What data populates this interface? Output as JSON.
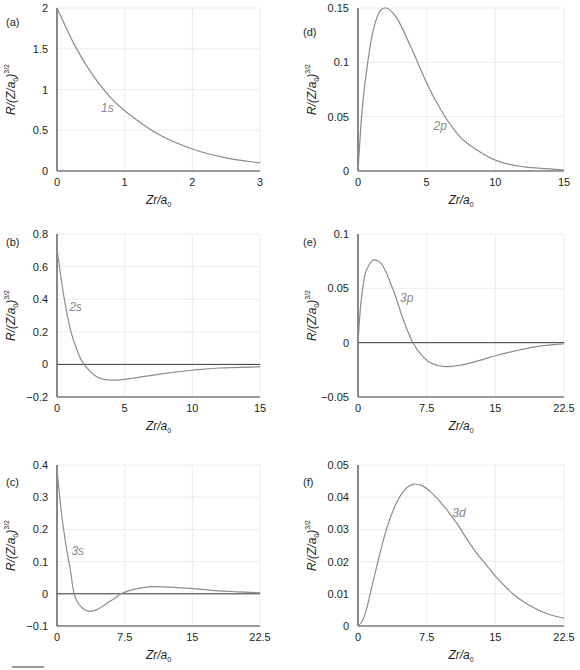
{
  "figure": {
    "footer_marker": "bar"
  },
  "chart_data": [
    {
      "id": "a",
      "panel_label": "(a)",
      "type": "line",
      "curve_label": "1s",
      "xlabel": "Zr/a0",
      "ylabel": "R/(Z/a0)^3/2",
      "xlim": [
        0,
        3
      ],
      "ylim": [
        0,
        2
      ],
      "xticks": [
        0,
        1,
        2,
        3
      ],
      "yticks": [
        0,
        0.5,
        1,
        1.5,
        2
      ],
      "xtick_labels": [
        "0",
        "1",
        "2",
        "3"
      ],
      "ytick_labels": [
        "0",
        "0.5",
        "1",
        "1.5",
        "2"
      ],
      "grid": true,
      "zero_line": false,
      "series": [
        {
          "name": "1s",
          "x": [
            0,
            0.25,
            0.5,
            0.75,
            1,
            1.5,
            2,
            2.5,
            3
          ],
          "values": [
            2,
            1.56,
            1.21,
            0.94,
            0.74,
            0.45,
            0.27,
            0.16,
            0.1
          ]
        }
      ],
      "label_pos": [
        0.65,
        0.72
      ]
    },
    {
      "id": "b",
      "panel_label": "(b)",
      "type": "line",
      "curve_label": "2s",
      "xlabel": "Zr/a0",
      "ylabel": "R/(Z/a0)^3/2",
      "xlim": [
        0,
        15
      ],
      "ylim": [
        -0.2,
        0.8
      ],
      "xticks": [
        0,
        5,
        10,
        15
      ],
      "yticks": [
        -0.2,
        0,
        0.2,
        0.4,
        0.6,
        0.8
      ],
      "xtick_labels": [
        "0",
        "5",
        "10",
        "15"
      ],
      "ytick_labels": [
        "−0.2",
        "0",
        "0.2",
        "0.4",
        "0.6",
        "0.8"
      ],
      "grid": true,
      "zero_line": true,
      "series": [
        {
          "name": "2s",
          "x": [
            0,
            0.5,
            1,
            1.5,
            2,
            3,
            4,
            5,
            6,
            8,
            10,
            12,
            15
          ],
          "values": [
            0.707,
            0.42,
            0.21,
            0.083,
            0,
            -0.079,
            -0.096,
            -0.092,
            -0.08,
            -0.055,
            -0.036,
            -0.022,
            -0.015
          ]
        }
      ],
      "label_pos": [
        0.9,
        0.33
      ]
    },
    {
      "id": "c",
      "panel_label": "(c)",
      "type": "line",
      "curve_label": "3s",
      "xlabel": "Zr/a0",
      "ylabel": "R/(Z/a0)^3/2",
      "xlim": [
        0,
        22.5
      ],
      "ylim": [
        -0.1,
        0.4
      ],
      "xticks": [
        0,
        7.5,
        15,
        22.5
      ],
      "yticks": [
        -0.1,
        0,
        0.1,
        0.2,
        0.3,
        0.4
      ],
      "xtick_labels": [
        "0",
        "7.5",
        "15",
        "22.5"
      ],
      "ytick_labels": [
        "−0.1",
        "0",
        "0.1",
        "0.2",
        "0.3",
        "0.4"
      ],
      "grid": true,
      "zero_line": true,
      "series": [
        {
          "name": "3s",
          "x": [
            0,
            0.5,
            1,
            1.5,
            1.9,
            2.5,
            3.5,
            4.5,
            5.5,
            6.5,
            7.1,
            8,
            9.5,
            11,
            13,
            15,
            17.5,
            20,
            22.5
          ],
          "values": [
            0.385,
            0.25,
            0.15,
            0.07,
            0,
            -0.035,
            -0.054,
            -0.048,
            -0.03,
            -0.012,
            0,
            0.01,
            0.019,
            0.022,
            0.02,
            0.016,
            0.01,
            0.006,
            0.003
          ]
        }
      ],
      "label_pos": [
        1.6,
        0.12
      ]
    },
    {
      "id": "d",
      "panel_label": "(d)",
      "type": "line",
      "curve_label": "2p",
      "xlabel": "Zr/a0",
      "ylabel": "R/(Z/a0)^3/2",
      "xlim": [
        0,
        15
      ],
      "ylim": [
        0,
        0.15
      ],
      "xticks": [
        0,
        5,
        10,
        15
      ],
      "yticks": [
        0,
        0.05,
        0.1,
        0.15
      ],
      "xtick_labels": [
        "0",
        "5",
        "10",
        "15"
      ],
      "ytick_labels": [
        "0",
        "0.05",
        "0.1",
        "0.15"
      ],
      "grid": true,
      "zero_line": false,
      "series": [
        {
          "name": "2p",
          "x": [
            0,
            0.25,
            0.5,
            1,
            1.5,
            2,
            2.5,
            3,
            4,
            5,
            6,
            7,
            8,
            10,
            12,
            15
          ],
          "values": [
            0,
            0.048,
            0.08,
            0.123,
            0.145,
            0.15,
            0.146,
            0.137,
            0.11,
            0.081,
            0.057,
            0.038,
            0.025,
            0.01,
            0.004,
            0.001
          ]
        }
      ],
      "label_pos": [
        5.5,
        0.038
      ]
    },
    {
      "id": "e",
      "panel_label": "(e)",
      "type": "line",
      "curve_label": "3p",
      "xlabel": "Zr/a0",
      "ylabel": "R/(Z/a0)^3/2",
      "xlim": [
        0,
        22.5
      ],
      "ylim": [
        -0.05,
        0.1
      ],
      "xticks": [
        0,
        7.5,
        15,
        22.5
      ],
      "yticks": [
        -0.05,
        0,
        0.05,
        0.1
      ],
      "xtick_labels": [
        "0",
        "7.5",
        "15",
        "22.5"
      ],
      "ytick_labels": [
        "−0.05",
        "0",
        "0.05",
        "0.1"
      ],
      "grid": true,
      "zero_line": true,
      "series": [
        {
          "name": "3p",
          "x": [
            0,
            0.3,
            0.7,
            1,
            1.5,
            2,
            2.5,
            3,
            4,
            5,
            6,
            7,
            8,
            9.5,
            11,
            13,
            15,
            17.5,
            20,
            22.5
          ],
          "values": [
            0,
            0.035,
            0.06,
            0.068,
            0.075,
            0.076,
            0.073,
            0.066,
            0.045,
            0.02,
            0,
            -0.012,
            -0.019,
            -0.022,
            -0.021,
            -0.017,
            -0.012,
            -0.007,
            -0.003,
            -0.001
          ]
        }
      ],
      "label_pos": [
        4.6,
        0.037
      ]
    },
    {
      "id": "f",
      "panel_label": "(f)",
      "type": "line",
      "curve_label": "3d",
      "xlabel": "Zr/a0",
      "ylabel": "R/(Z/a0)^3/2",
      "xlim": [
        0,
        22.5
      ],
      "ylim": [
        0,
        0.05
      ],
      "xticks": [
        0,
        7.5,
        15,
        22.5
      ],
      "yticks": [
        0,
        0.01,
        0.02,
        0.03,
        0.04,
        0.05
      ],
      "xtick_labels": [
        "0",
        "7.5",
        "15",
        "22.5"
      ],
      "ytick_labels": [
        "0",
        "0.01",
        "0.02",
        "0.03",
        "0.04",
        "0.05"
      ],
      "grid": true,
      "zero_line": false,
      "series": [
        {
          "name": "3d",
          "x": [
            0,
            0.5,
            1,
            1.5,
            2,
            3,
            4,
            5,
            6,
            7,
            8,
            9,
            10,
            11,
            12,
            13,
            14,
            15,
            16,
            17,
            18,
            19,
            20,
            21,
            22.5
          ],
          "values": [
            0,
            0.0017,
            0.006,
            0.012,
            0.018,
            0.029,
            0.037,
            0.042,
            0.044,
            0.0436,
            0.0415,
            0.0385,
            0.035,
            0.031,
            0.0265,
            0.0225,
            0.019,
            0.0155,
            0.0125,
            0.0098,
            0.0077,
            0.006,
            0.0046,
            0.0035,
            0.0024
          ]
        }
      ],
      "label_pos": [
        10.3,
        0.034
      ]
    }
  ]
}
